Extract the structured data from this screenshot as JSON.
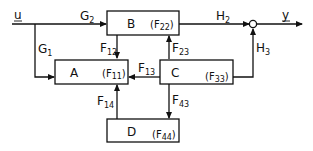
{
  "diagram": {
    "type": "block-diagram",
    "input": {
      "label": "u"
    },
    "output": {
      "label": "y"
    },
    "blocks": [
      {
        "id": "B",
        "label": "B",
        "feedback": "F",
        "feedback_sub": "22"
      },
      {
        "id": "A",
        "label": "A",
        "feedback": "F",
        "feedback_sub": "11"
      },
      {
        "id": "C",
        "label": "C",
        "feedback": "F",
        "feedback_sub": "33"
      },
      {
        "id": "D",
        "label": "D",
        "feedback": "F",
        "feedback_sub": "44"
      }
    ],
    "edges": [
      {
        "from": "u",
        "to": "B",
        "label": "G",
        "sub": "2"
      },
      {
        "from": "u",
        "to": "A",
        "label": "G",
        "sub": "1"
      },
      {
        "from": "B",
        "to": "A",
        "label": "F",
        "sub": "12"
      },
      {
        "from": "C",
        "to": "B",
        "label": "F",
        "sub": "23"
      },
      {
        "from": "C",
        "to": "A",
        "label": "F",
        "sub": "13"
      },
      {
        "from": "D",
        "to": "A",
        "label": "F",
        "sub": "14"
      },
      {
        "from": "C",
        "to": "D",
        "label": "F",
        "sub": "43"
      },
      {
        "from": "B",
        "to": "sum",
        "label": "H",
        "sub": "2"
      },
      {
        "from": "C",
        "to": "sum",
        "label": "H",
        "sub": "3"
      },
      {
        "from": "sum",
        "to": "y",
        "label": "",
        "sub": ""
      }
    ]
  }
}
